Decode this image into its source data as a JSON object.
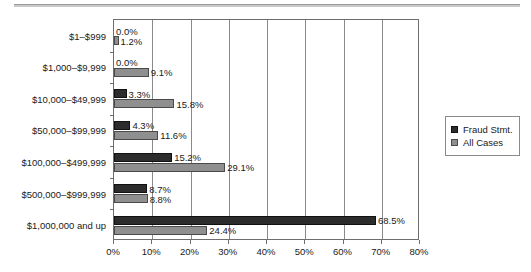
{
  "chart_data": {
    "type": "bar",
    "orientation": "horizontal",
    "title": "",
    "xlabel": "",
    "ylabel": "",
    "xlim": [
      0,
      80
    ],
    "xticks": [
      "0%",
      "10%",
      "20%",
      "30%",
      "40%",
      "50%",
      "60%",
      "70%",
      "80%"
    ],
    "xtick_values": [
      0,
      10,
      20,
      30,
      40,
      50,
      60,
      70,
      80
    ],
    "grid": "vertical",
    "legend_position": "right",
    "categories": [
      "$1–$999",
      "$1,000–$9,999",
      "$10,000–$49,999",
      "$50,000–$99,999",
      "$100,000–$499,999",
      "$500,000–$999,999",
      "$1,000,000 and up"
    ],
    "series": [
      {
        "name": "Fraud Stmt.",
        "color": "#2c2c2c",
        "values": [
          0.0,
          0.0,
          3.3,
          4.3,
          15.2,
          8.7,
          68.5
        ],
        "labels": [
          "0.0%",
          "0.0%",
          "3.3%",
          "4.3%",
          "15.2%",
          "8.7%",
          "68.5%"
        ]
      },
      {
        "name": "All Cases",
        "color": "#8f8f8f",
        "values": [
          1.2,
          9.1,
          15.8,
          11.6,
          29.1,
          8.8,
          24.4
        ],
        "labels": [
          "1.2%",
          "9.1%",
          "15.8%",
          "11.6%",
          "29.1%",
          "8.8%",
          "24.4%"
        ]
      }
    ]
  },
  "legend": {
    "items": [
      {
        "label": "Fraud Stmt.",
        "swatch": "dark"
      },
      {
        "label": "All Cases",
        "swatch": "light"
      }
    ]
  }
}
